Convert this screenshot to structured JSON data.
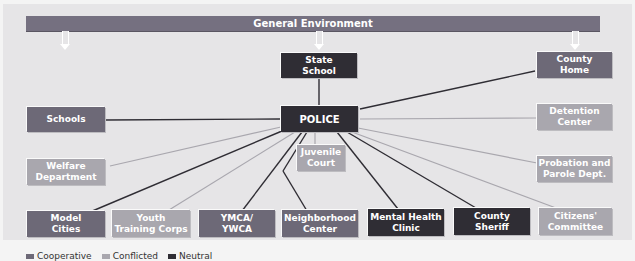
{
  "diagram": {
    "environment_label": "General Environment",
    "center": {
      "label": "POLICE",
      "category": "neutral"
    },
    "nodes": [
      {
        "id": "state-school",
        "label": "State\nSchool",
        "category": "neutral",
        "link": "neutral"
      },
      {
        "id": "county-home",
        "label": "County\nHome",
        "category": "cooperative",
        "link": "neutral"
      },
      {
        "id": "schools",
        "label": "Schools",
        "category": "cooperative",
        "link": "neutral"
      },
      {
        "id": "detention-center",
        "label": "Detention\nCenter",
        "category": "conflicted",
        "link": "conflicted"
      },
      {
        "id": "welfare-department",
        "label": "Welfare\nDepartment",
        "category": "conflicted",
        "link": "conflicted"
      },
      {
        "id": "juvenile-court",
        "label": "Juvenile\nCourt",
        "category": "conflicted",
        "link": "conflicted"
      },
      {
        "id": "probation-parole",
        "label": "Probation and\nParole Dept.",
        "category": "conflicted",
        "link": "conflicted"
      },
      {
        "id": "model-cities",
        "label": "Model\nCities",
        "category": "cooperative",
        "link": "neutral"
      },
      {
        "id": "youth-training-corps",
        "label": "Youth\nTraining Corps",
        "category": "conflicted",
        "link": "conflicted"
      },
      {
        "id": "ymca-ywca",
        "label": "YMCA/\nYWCA",
        "category": "cooperative",
        "link": "neutral"
      },
      {
        "id": "neighborhood-center",
        "label": "Neighborhood\nCenter",
        "category": "cooperative",
        "link": "neutral"
      },
      {
        "id": "mental-health-clinic",
        "label": "Mental Health\nClinic",
        "category": "neutral",
        "link": "neutral"
      },
      {
        "id": "county-sheriff",
        "label": "County\nSheriff",
        "category": "neutral",
        "link": "neutral"
      },
      {
        "id": "citizens-committee",
        "label": "Citizens'\nCommittee",
        "category": "conflicted",
        "link": "conflicted"
      }
    ]
  },
  "legend": {
    "items": [
      {
        "label": "Cooperative",
        "color": "#6d6977"
      },
      {
        "label": "Conflicted",
        "color": "#a9a7ae"
      },
      {
        "label": "Neutral",
        "color": "#2f2d34"
      }
    ]
  },
  "colors": {
    "cooperative": "#6d6977",
    "conflicted": "#a9a7ae",
    "neutral": "#2f2d34",
    "environment_bar": "#757080",
    "background": "#e6e5e7"
  }
}
